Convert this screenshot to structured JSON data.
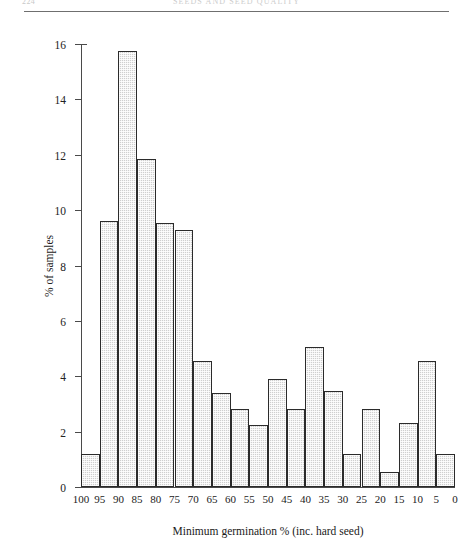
{
  "header": {
    "folio": "224",
    "title": "SEEDS AND SEED QUALITY"
  },
  "chart_data": {
    "type": "bar",
    "title": "",
    "xlabel": "Minimum germination % (inc. hard seed)",
    "ylabel": "% of samples",
    "ylim": [
      0,
      16
    ],
    "ytick_labels": [
      "0",
      "2",
      "4",
      "6",
      "8",
      "10",
      "12",
      "14",
      "16"
    ],
    "ytick_values": [
      0,
      2,
      4,
      6,
      8,
      10,
      12,
      14,
      16
    ],
    "xtick_labels": [
      "100",
      "95",
      "90",
      "85",
      "80",
      "75",
      "70",
      "65",
      "60",
      "55",
      "50",
      "45",
      "40",
      "35",
      "30",
      "25",
      "20",
      "15",
      "10",
      "5",
      "0"
    ],
    "xtick_values": [
      100,
      95,
      90,
      85,
      80,
      75,
      70,
      65,
      60,
      55,
      50,
      45,
      40,
      35,
      30,
      25,
      20,
      15,
      10,
      5,
      0
    ],
    "grid": false,
    "legend": "none",
    "bin_edges": [
      100,
      95,
      90,
      85,
      80,
      75,
      70,
      65,
      60,
      55,
      50,
      45,
      40,
      35,
      30,
      25,
      20,
      15,
      10,
      5,
      0
    ],
    "categories": [
      "100-95",
      "95-90",
      "90-85",
      "85-80",
      "80-75",
      "75-70",
      "70-65",
      "65-60",
      "60-55",
      "55-50",
      "50-45",
      "45-40",
      "40-35",
      "35-30",
      "30-25",
      "25-20",
      "20-15",
      "15-10",
      "10-5",
      "5-0"
    ],
    "values": [
      1.2,
      9.6,
      15.75,
      11.85,
      9.55,
      9.3,
      4.55,
      3.4,
      2.8,
      2.25,
      3.9,
      2.8,
      5.05,
      3.45,
      1.2,
      2.8,
      0.55,
      2.3,
      4.55,
      1.2
    ],
    "bar_fill": "#cfcfcf",
    "bar_edge": "#2b2b2b",
    "axis_color": "#4a4a4a"
  }
}
